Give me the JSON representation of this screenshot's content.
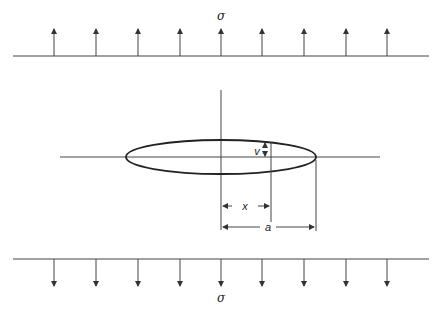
{
  "diagram": {
    "labels": {
      "stress_top": "σ",
      "stress_bottom": "σ",
      "opening": "v",
      "position": "x",
      "half_length": "a"
    },
    "arrows": {
      "count_top": 9,
      "count_bottom": 9,
      "direction_top": "up",
      "direction_bottom": "down"
    },
    "colors": {
      "stroke": "#333333",
      "background": "#ffffff"
    }
  }
}
